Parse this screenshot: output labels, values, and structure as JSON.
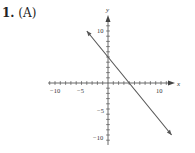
{
  "problem": {
    "number": "1.",
    "choice": "(A)"
  },
  "chart_data": {
    "type": "line",
    "title": "",
    "xlabel": "x",
    "ylabel": "y",
    "xlim": [
      -12,
      12
    ],
    "ylim": [
      -12,
      12
    ],
    "x_ticks": [
      -10,
      -5,
      10
    ],
    "y_ticks": [
      10,
      -5,
      -10
    ],
    "grid": false,
    "series": [
      {
        "name": "line",
        "x": [
          -4,
          12
        ],
        "y": [
          10,
          -10
        ],
        "slope": -1.25,
        "y_intercept": 5,
        "x_intercept": 4
      }
    ]
  }
}
